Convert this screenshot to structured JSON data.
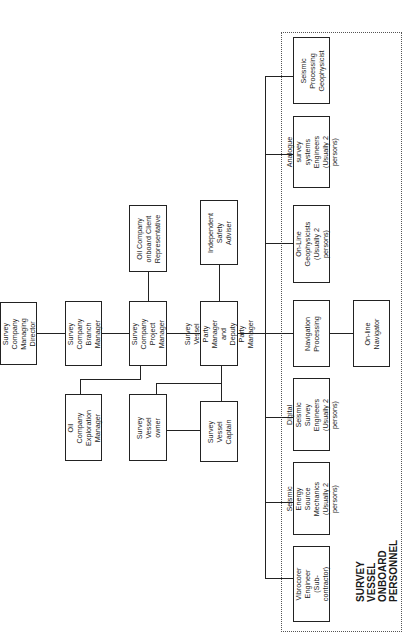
{
  "diagram": {
    "type": "organization-chart",
    "orientation": "rotated-90-ccw",
    "group_label": "SURVEY VESSEL  ONBOARD\nPERSONNEL",
    "nodes": {
      "managing_director": "Survey Company\nManaging\nDirector",
      "branch_manager": "Survey Company\nBranch Manager",
      "project_manager": "Survey Company\nProject Manager",
      "client_rep": "Oil Company\nonboard Client\nRepresentative",
      "exploration_manager": "Oil Company\nExploration\nManager",
      "vessel_owner": "Survey Vessel\nowner",
      "party_manager": "Survey Vessel\nParty Manager\nand Deputy Party\nManager",
      "safety_adviser": "Independent\nSafety\nAdviser",
      "captain": "Survey Vessel\nCaptain",
      "seismic_processing": "Seismic\nProcessing\nGeophysicist",
      "analogue_engineers": "Analogue survey\nsystems Engineers\n(Usually 2 persons)",
      "online_geophysicists": "On-Line\nGeophysicists\n(Usually 2 persons)",
      "navigation_processing": "Navigation\nProcessing",
      "online_navigator": "On-line Navigator",
      "digital_engineers": "Digital Seismic\nSurvey Engineers\n(Usually 2 persons)",
      "energy_mechanics": "Seismic Energy\nSource Mechanics\n(Usually 2 persons)",
      "vibrocorer": "Vibrocorer\nEngineer\n(Sub-contractor)"
    },
    "edges": [
      [
        "managing_director",
        "branch_manager"
      ],
      [
        "branch_manager",
        "project_manager"
      ],
      [
        "project_manager",
        "client_rep"
      ],
      [
        "project_manager",
        "exploration_manager"
      ],
      [
        "project_manager",
        "party_manager"
      ],
      [
        "party_manager",
        "safety_adviser"
      ],
      [
        "party_manager",
        "vessel_owner"
      ],
      [
        "party_manager",
        "captain"
      ],
      [
        "vessel_owner",
        "captain"
      ],
      [
        "party_manager",
        "seismic_processing"
      ],
      [
        "party_manager",
        "analogue_engineers"
      ],
      [
        "party_manager",
        "online_geophysicists"
      ],
      [
        "party_manager",
        "navigation_processing"
      ],
      [
        "navigation_processing",
        "online_navigator"
      ],
      [
        "party_manager",
        "digital_engineers"
      ],
      [
        "party_manager",
        "energy_mechanics"
      ],
      [
        "party_manager",
        "vibrocorer"
      ]
    ]
  }
}
